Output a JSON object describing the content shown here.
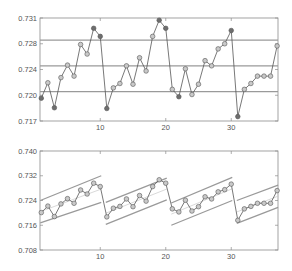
{
  "chart_data": [
    {
      "type": "line",
      "title": "",
      "xlabel": "",
      "ylabel": "",
      "xlim": [
        1,
        37
      ],
      "ylim": [
        0.717,
        0.731
      ],
      "grid": false,
      "xticks": [
        10,
        20,
        30
      ],
      "xtick_labels": [
        "10",
        "20",
        "30"
      ],
      "yticks": [
        0.717,
        0.7205,
        0.724,
        0.7275,
        0.731
      ],
      "ytick_labels": [
        "0.717",
        "0.720",
        "0.724",
        "0.728",
        "0.731"
      ],
      "control_limits": {
        "ucl": 0.728,
        "cl": 0.7245,
        "lcl": 0.721
      },
      "series": [
        {
          "name": "measurements",
          "x": [
            1,
            2,
            3,
            4,
            5,
            6,
            7,
            8,
            9,
            10,
            11,
            12,
            13,
            14,
            15,
            16,
            17,
            18,
            19,
            20,
            21,
            22,
            23,
            24,
            25,
            26,
            27,
            28,
            29,
            30,
            31,
            32,
            33,
            34,
            35,
            36,
            37
          ],
          "values": [
            0.7201,
            0.7222,
            0.7188,
            0.7229,
            0.7246,
            0.7231,
            0.7274,
            0.7261,
            0.7296,
            0.7285,
            0.7187,
            0.7215,
            0.7221,
            0.7245,
            0.722,
            0.7256,
            0.7238,
            0.7285,
            0.7307,
            0.7296,
            0.7213,
            0.7203,
            0.7241,
            0.7206,
            0.722,
            0.7252,
            0.7245,
            0.7268,
            0.7275,
            0.7293,
            0.7176,
            0.7213,
            0.7221,
            0.7231,
            0.7231,
            0.7231,
            0.7272
          ],
          "out_of_control": [
            1,
            3,
            9,
            10,
            11,
            19,
            20,
            22,
            30,
            31
          ]
        }
      ]
    },
    {
      "type": "line",
      "title": "",
      "xlabel": "",
      "ylabel": "",
      "xlim": [
        1,
        37
      ],
      "ylim": [
        0.708,
        0.74
      ],
      "grid": false,
      "xticks": [
        10,
        20,
        30
      ],
      "xtick_labels": [
        "10",
        "20",
        "30"
      ],
      "yticks": [
        0.708,
        0.716,
        0.724,
        0.732,
        0.74
      ],
      "ytick_labels": [
        "0.708",
        "0.716",
        "0.724",
        "0.732",
        "0.740"
      ],
      "segments": [
        {
          "x_start": 1,
          "x_end": 10,
          "ucl": [
            0.724,
            0.732
          ],
          "cl": [
            0.7204,
            0.7277
          ],
          "lcl": [
            0.7168,
            0.7234
          ]
        },
        {
          "x_start": 11,
          "x_end": 20,
          "ucl": [
            0.7234,
            0.7312
          ],
          "cl": [
            0.7199,
            0.7277
          ],
          "lcl": [
            0.7163,
            0.7242
          ]
        },
        {
          "x_start": 21,
          "x_end": 30,
          "ucl": [
            0.7232,
            0.7315
          ],
          "cl": [
            0.7196,
            0.7278
          ],
          "lcl": [
            0.716,
            0.724
          ]
        },
        {
          "x_start": 31,
          "x_end": 37,
          "ucl": [
            0.724,
            0.729
          ],
          "cl": [
            0.7203,
            0.7254
          ],
          "lcl": [
            0.7166,
            0.7218
          ]
        }
      ],
      "series": [
        {
          "name": "measurements",
          "x": [
            1,
            2,
            3,
            4,
            5,
            6,
            7,
            8,
            9,
            10,
            11,
            12,
            13,
            14,
            15,
            16,
            17,
            18,
            19,
            20,
            21,
            22,
            23,
            24,
            25,
            26,
            27,
            28,
            29,
            30,
            31,
            32,
            33,
            34,
            35,
            36,
            37
          ],
          "values": [
            0.7201,
            0.7222,
            0.7188,
            0.7229,
            0.7246,
            0.7231,
            0.7274,
            0.7261,
            0.7296,
            0.7285,
            0.7187,
            0.7215,
            0.7221,
            0.7245,
            0.722,
            0.7256,
            0.7238,
            0.7285,
            0.7307,
            0.7296,
            0.7213,
            0.7203,
            0.7241,
            0.7206,
            0.722,
            0.7252,
            0.7245,
            0.7268,
            0.7275,
            0.7293,
            0.7176,
            0.7213,
            0.7221,
            0.7231,
            0.7231,
            0.7231,
            0.7272
          ]
        }
      ]
    }
  ],
  "colors": {
    "axis": "#8c8c8c",
    "line": "#555555",
    "limit": "#9a9a9a",
    "center": "#c8c8c8",
    "marker_fill": "#c9c9c9",
    "marker_dark": "#6e6e6e",
    "marker_edge": "#555555"
  }
}
